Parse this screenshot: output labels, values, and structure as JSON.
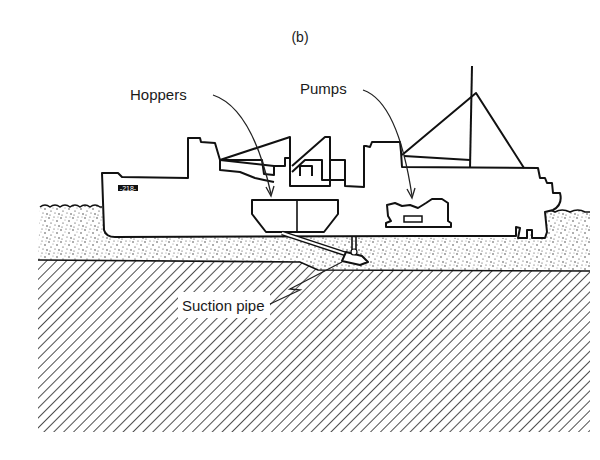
{
  "figure": {
    "caption": "(b)",
    "type": "cross-section illustration of a trailing suction hopper dredger",
    "labels": {
      "hoppers": "Hoppers",
      "pumps": "Pumps",
      "suction_pipe": "Suction pipe"
    },
    "hull_marking": "-218-",
    "layers": {
      "water_surface": "wavy line",
      "loose_sediment": "stippled layer",
      "seabed": "diagonal hatched layer"
    },
    "colors": {
      "line": "#111111",
      "background": "#ffffff"
    }
  }
}
